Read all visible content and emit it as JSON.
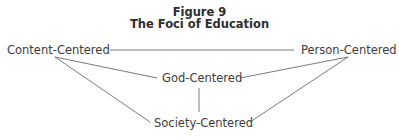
{
  "figure": {
    "label": "Figure 9",
    "title": "The Foci of Education"
  },
  "nodes": {
    "content": "Content-Centered",
    "person": "Person-Centered",
    "god": "God-Centered",
    "society": "Society-Centered"
  },
  "edges": [
    {
      "from": "content",
      "to": "person"
    },
    {
      "from": "content",
      "to": "god"
    },
    {
      "from": "content",
      "to": "society"
    },
    {
      "from": "person",
      "to": "god"
    },
    {
      "from": "person",
      "to": "society"
    },
    {
      "from": "god",
      "to": "society"
    }
  ]
}
